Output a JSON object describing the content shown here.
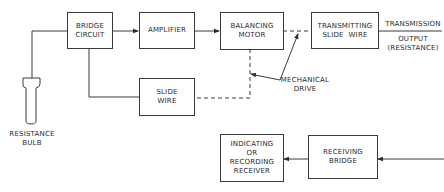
{
  "diagram": {
    "type": "block-diagram",
    "title": "",
    "blocks": {
      "bridge_circuit": {
        "line1": "BRIDGE",
        "line2": "CIRCUIT"
      },
      "amplifier": {
        "line1": "AMPLIFIER"
      },
      "balancing_motor": {
        "line1": "BALANCING",
        "line2": "MOTOR"
      },
      "transmitting_slide_wire": {
        "line1": "TRANSMITTING",
        "line2": "SLIDE  WIRE"
      },
      "slide_wire": {
        "line1": "SLIDE",
        "line2": "WIRE"
      },
      "indicating_receiver": {
        "line1": "INDICATING",
        "line2": "OR",
        "line3": "RECORDING",
        "line4": "RECEIVER"
      },
      "receiving_bridge": {
        "line1": "RECEIVING",
        "line2": "BRIDGE"
      }
    },
    "labels": {
      "resistance_bulb": {
        "line1": "RESISTANCE",
        "line2": "BULB"
      },
      "mechanical_drive": {
        "line1": "MECHANICAL",
        "line2": "DRIVE"
      },
      "transmission_output": {
        "line1": "TRANSMISSION",
        "line2": "OUTPUT",
        "line3": "(RESISTANCE)"
      }
    },
    "connections": [
      {
        "from": "resistance_bulb",
        "to": "bridge_circuit",
        "style": "solid"
      },
      {
        "from": "bridge_circuit",
        "to": "amplifier",
        "style": "arrow"
      },
      {
        "from": "amplifier",
        "to": "balancing_motor",
        "style": "arrow"
      },
      {
        "from": "balancing_motor",
        "to": "transmitting_slide_wire",
        "style": "dashed",
        "label": "mechanical_drive"
      },
      {
        "from": "balancing_motor",
        "to": "slide_wire",
        "style": "dashed",
        "label": "mechanical_drive"
      },
      {
        "from": "bridge_circuit",
        "to": "slide_wire",
        "style": "solid"
      },
      {
        "from": "transmitting_slide_wire",
        "to": "transmission_output",
        "style": "solid"
      },
      {
        "from": "input",
        "to": "receiving_bridge",
        "style": "arrow"
      },
      {
        "from": "receiving_bridge",
        "to": "indicating_receiver",
        "style": "arrow"
      }
    ],
    "colors": {
      "line": "#3a3a3a",
      "background": "#ffffff"
    }
  }
}
